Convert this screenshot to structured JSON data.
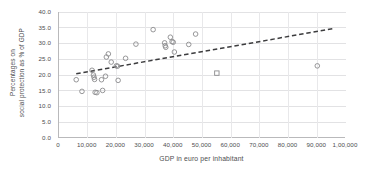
{
  "chart_data": {
    "type": "scatter",
    "title": "",
    "xlabel": "GDP in euro per inhabitant",
    "ylabel_line1": "Percentages on",
    "ylabel_line2": "social protection as % of GDP",
    "xlim": [
      0,
      100000
    ],
    "ylim": [
      0,
      40
    ],
    "grid": true,
    "legend": "none",
    "xticks": [
      0,
      10000,
      20000,
      30000,
      40000,
      50000,
      60000,
      70000,
      80000,
      90000,
      100000
    ],
    "xticklabels": [
      "0",
      "10,000",
      "20,000",
      "30,000",
      "40,000",
      "50,000",
      "60,000",
      "70,000",
      "80,000",
      "90,000",
      "1,00,000"
    ],
    "yticks": [
      0,
      5,
      10,
      15,
      20,
      25,
      30,
      35,
      40
    ],
    "yticklabels": [
      "0.0",
      "5.0",
      "10.0",
      "15.0",
      "20.0",
      "25.0",
      "30.0",
      "35.0",
      "40.0"
    ],
    "marker": "open-circle",
    "marker_color": "#8b8b8d",
    "points": [
      {
        "x": 6000,
        "y": 18.5,
        "marker": "circle"
      },
      {
        "x": 8000,
        "y": 14.8,
        "marker": "circle"
      },
      {
        "x": 11500,
        "y": 21.5,
        "marker": "circle"
      },
      {
        "x": 12000,
        "y": 20.0,
        "marker": "circle"
      },
      {
        "x": 12200,
        "y": 19.3,
        "marker": "circle"
      },
      {
        "x": 12400,
        "y": 18.6,
        "marker": "circle"
      },
      {
        "x": 12600,
        "y": 14.5,
        "marker": "circle"
      },
      {
        "x": 13200,
        "y": 14.4,
        "marker": "circle"
      },
      {
        "x": 14800,
        "y": 18.5,
        "marker": "circle"
      },
      {
        "x": 15200,
        "y": 15.1,
        "marker": "circle"
      },
      {
        "x": 16200,
        "y": 19.6,
        "marker": "circle"
      },
      {
        "x": 16500,
        "y": 25.7,
        "marker": "circle"
      },
      {
        "x": 17200,
        "y": 26.7,
        "marker": "circle"
      },
      {
        "x": 18200,
        "y": 24.1,
        "marker": "circle"
      },
      {
        "x": 20000,
        "y": 22.9,
        "marker": "circle"
      },
      {
        "x": 20400,
        "y": 22.8,
        "marker": "circle"
      },
      {
        "x": 20600,
        "y": 18.3,
        "marker": "circle"
      },
      {
        "x": 23200,
        "y": 25.3,
        "marker": "circle"
      },
      {
        "x": 26800,
        "y": 29.8,
        "marker": "circle"
      },
      {
        "x": 32800,
        "y": 34.4,
        "marker": "circle"
      },
      {
        "x": 36800,
        "y": 30.2,
        "marker": "circle"
      },
      {
        "x": 37000,
        "y": 29.3,
        "marker": "circle"
      },
      {
        "x": 37200,
        "y": 28.8,
        "marker": "circle"
      },
      {
        "x": 38800,
        "y": 32.0,
        "marker": "circle"
      },
      {
        "x": 39400,
        "y": 30.6,
        "marker": "circle"
      },
      {
        "x": 39800,
        "y": 30.4,
        "marker": "circle"
      },
      {
        "x": 40200,
        "y": 27.3,
        "marker": "circle"
      },
      {
        "x": 45200,
        "y": 29.7,
        "marker": "circle"
      },
      {
        "x": 47600,
        "y": 33.0,
        "marker": "circle"
      },
      {
        "x": 55000,
        "y": 20.6,
        "marker": "square"
      },
      {
        "x": 90000,
        "y": 22.9,
        "marker": "circle"
      }
    ],
    "trendline": {
      "style": "dashed",
      "color": "#3c3c3e",
      "x_start": 6000,
      "y_start": 20.4,
      "x_end": 96000,
      "y_end": 34.8
    }
  }
}
